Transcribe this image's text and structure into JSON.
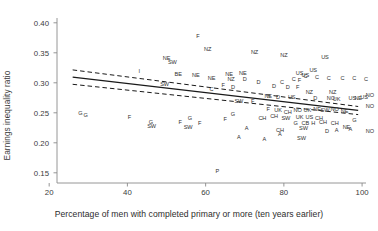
{
  "chart_data": {
    "type": "scatter",
    "title": "",
    "xlabel": "Percentage of men with completed primary or more (ten years earlier)",
    "ylabel": "Earnings inequality ratio",
    "xlim": [
      22,
      101
    ],
    "ylim": [
      0.133,
      0.408
    ],
    "xticks": [
      20,
      40,
      60,
      80,
      100
    ],
    "yticks": [
      "0.15",
      "0.20",
      "0.25",
      "0.30",
      "0.35",
      "0.40"
    ],
    "ytick_values": [
      0.15,
      0.2,
      0.25,
      0.3,
      0.35,
      0.4
    ],
    "grid": false,
    "legend": "none",
    "marker_style": "country-code-text-labels",
    "regression_line": {
      "style": "solid",
      "x": [
        26.0,
        99.0
      ],
      "y": [
        0.3095,
        0.254
      ]
    },
    "confidence_bands": [
      {
        "name": "upper",
        "style": "dashed",
        "x": [
          26.0,
          99.0
        ],
        "y": [
          0.3215,
          0.2605
        ]
      },
      {
        "name": "lower",
        "style": "dashed",
        "x": [
          26.0,
          99.0
        ],
        "y": [
          0.2975,
          0.247
        ]
      }
    ],
    "points": [
      {
        "label": "G",
        "x": 28.0,
        "y": 0.25
      },
      {
        "label": "G",
        "x": 29.3,
        "y": 0.247
      },
      {
        "label": "I",
        "x": 43.0,
        "y": 0.319
      },
      {
        "label": "F",
        "x": 40.5,
        "y": 0.243
      },
      {
        "label": "G",
        "x": 46.0,
        "y": 0.235
      },
      {
        "label": "SW",
        "x": 46.2,
        "y": 0.2275
      },
      {
        "label": "NE",
        "x": 50.0,
        "y": 0.3415
      },
      {
        "label": "SW",
        "x": 51.5,
        "y": 0.3345
      },
      {
        "label": "BE",
        "x": 53.0,
        "y": 0.3155
      },
      {
        "label": "SW",
        "x": 49.5,
        "y": 0.2975
      },
      {
        "label": "NE",
        "x": 57.5,
        "y": 0.313
      },
      {
        "label": "NE",
        "x": 61.5,
        "y": 0.3075
      },
      {
        "label": "F",
        "x": 58.0,
        "y": 0.3775
      },
      {
        "label": "NZ",
        "x": 60.5,
        "y": 0.356
      },
      {
        "label": "NE",
        "x": 66.0,
        "y": 0.3155
      },
      {
        "label": "NE",
        "x": 69.5,
        "y": 0.316
      },
      {
        "label": "NZ",
        "x": 66.5,
        "y": 0.3065
      },
      {
        "label": "D",
        "x": 70.0,
        "y": 0.306
      },
      {
        "label": "F",
        "x": 64.5,
        "y": 0.296
      },
      {
        "label": "D",
        "x": 67.0,
        "y": 0.293
      },
      {
        "label": "C",
        "x": 61.5,
        "y": 0.29
      },
      {
        "label": "F",
        "x": 53.5,
        "y": 0.234
      },
      {
        "label": "G",
        "x": 56.0,
        "y": 0.242
      },
      {
        "label": "F",
        "x": 58.5,
        "y": 0.233
      },
      {
        "label": "SW",
        "x": 55.5,
        "y": 0.2265
      },
      {
        "label": "NZ",
        "x": 72.5,
        "y": 0.352
      },
      {
        "label": "NZ",
        "x": 80.0,
        "y": 0.347
      },
      {
        "label": "D",
        "x": 73.5,
        "y": 0.302
      },
      {
        "label": "D",
        "x": 77.5,
        "y": 0.2945
      },
      {
        "label": "C",
        "x": 79.5,
        "y": 0.301
      },
      {
        "label": "C",
        "x": 82.5,
        "y": 0.306
      },
      {
        "label": "F",
        "x": 84.0,
        "y": 0.304
      },
      {
        "label": "C",
        "x": 85.5,
        "y": 0.3115
      },
      {
        "label": "US",
        "x": 84.0,
        "y": 0.3165
      },
      {
        "label": "US",
        "x": 85.5,
        "y": 0.3135
      },
      {
        "label": "US",
        "x": 87.5,
        "y": 0.3215
      },
      {
        "label": "C",
        "x": 88.5,
        "y": 0.31
      },
      {
        "label": "US",
        "x": 90.5,
        "y": 0.343
      },
      {
        "label": "C",
        "x": 91.5,
        "y": 0.3075
      },
      {
        "label": "C",
        "x": 95.0,
        "y": 0.3075
      },
      {
        "label": "C",
        "x": 98.0,
        "y": 0.3075
      },
      {
        "label": "C",
        "x": 101.0,
        "y": 0.306
      },
      {
        "label": "D",
        "x": 81.0,
        "y": 0.293
      },
      {
        "label": "F",
        "x": 83.5,
        "y": 0.2925
      },
      {
        "label": "NZ",
        "x": 86.5,
        "y": 0.2855
      },
      {
        "label": "NZ",
        "x": 92.5,
        "y": 0.284
      },
      {
        "label": "NE",
        "x": 76.0,
        "y": 0.2775
      },
      {
        "label": "D",
        "x": 78.5,
        "y": 0.276
      },
      {
        "label": "US",
        "x": 82.0,
        "y": 0.2765
      },
      {
        "label": "SW",
        "x": 68.5,
        "y": 0.27
      },
      {
        "label": "F",
        "x": 72.0,
        "y": 0.27
      },
      {
        "label": "D",
        "x": 88.0,
        "y": 0.274
      },
      {
        "label": "NO",
        "x": 92.0,
        "y": 0.2745
      },
      {
        "label": "UK",
        "x": 93.5,
        "y": 0.273
      },
      {
        "label": "US",
        "x": 97.5,
        "y": 0.2755
      },
      {
        "label": "NE",
        "x": 99.0,
        "y": 0.275
      },
      {
        "label": "US",
        "x": 100.5,
        "y": 0.276
      },
      {
        "label": "NO",
        "x": 102.0,
        "y": 0.279
      },
      {
        "label": "G",
        "x": 67.0,
        "y": 0.2475
      },
      {
        "label": "F",
        "x": 65.0,
        "y": 0.2395
      },
      {
        "label": "F",
        "x": 76.0,
        "y": 0.257
      },
      {
        "label": "UK",
        "x": 78.5,
        "y": 0.2545
      },
      {
        "label": "CH",
        "x": 81.0,
        "y": 0.252
      },
      {
        "label": "NO",
        "x": 83.5,
        "y": 0.2545
      },
      {
        "label": "UK",
        "x": 86.0,
        "y": 0.254
      },
      {
        "label": "NE",
        "x": 88.5,
        "y": 0.256
      },
      {
        "label": "SW",
        "x": 90.5,
        "y": 0.2545
      },
      {
        "label": "NO",
        "x": 93.0,
        "y": 0.256
      },
      {
        "label": "NE",
        "x": 95.5,
        "y": 0.253
      },
      {
        "label": "NO",
        "x": 102.0,
        "y": 0.261
      },
      {
        "label": "CH",
        "x": 74.5,
        "y": 0.242
      },
      {
        "label": "CH",
        "x": 77.5,
        "y": 0.2445
      },
      {
        "label": "SW",
        "x": 80.5,
        "y": 0.242
      },
      {
        "label": "UK",
        "x": 84.0,
        "y": 0.243
      },
      {
        "label": "US",
        "x": 86.5,
        "y": 0.243
      },
      {
        "label": "CH",
        "x": 89.0,
        "y": 0.2415
      },
      {
        "label": "G",
        "x": 83.0,
        "y": 0.233
      },
      {
        "label": "CB",
        "x": 85.5,
        "y": 0.2325
      },
      {
        "label": "H",
        "x": 87.5,
        "y": 0.2325
      },
      {
        "label": "CH",
        "x": 90.0,
        "y": 0.2345
      },
      {
        "label": "CH",
        "x": 93.0,
        "y": 0.233
      },
      {
        "label": "G",
        "x": 98.0,
        "y": 0.2375
      },
      {
        "label": "NE",
        "x": 96.0,
        "y": 0.227
      },
      {
        "label": "A",
        "x": 70.5,
        "y": 0.2245
      },
      {
        "label": "CH",
        "x": 79.0,
        "y": 0.2215
      },
      {
        "label": "SW",
        "x": 85.0,
        "y": 0.224
      },
      {
        "label": "D",
        "x": 91.0,
        "y": 0.2205
      },
      {
        "label": "A",
        "x": 93.5,
        "y": 0.2215
      },
      {
        "label": "A",
        "x": 97.0,
        "y": 0.223
      },
      {
        "label": "NO",
        "x": 102.0,
        "y": 0.219
      },
      {
        "label": "A",
        "x": 68.5,
        "y": 0.2095
      },
      {
        "label": "A",
        "x": 75.0,
        "y": 0.2065
      },
      {
        "label": "SW",
        "x": 84.5,
        "y": 0.208
      },
      {
        "label": "A",
        "x": 79.0,
        "y": 0.215
      },
      {
        "label": "P",
        "x": 63.0,
        "y": 0.153
      }
    ]
  }
}
